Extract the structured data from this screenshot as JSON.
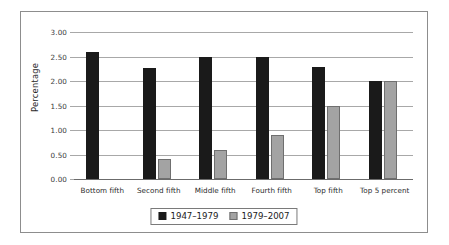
{
  "chart_data": {
    "type": "bar",
    "title": "",
    "xlabel": "",
    "ylabel": "Percentage",
    "ylim": [
      0,
      3.0
    ],
    "ytick_labels": [
      "0.00",
      "0.50",
      "1.00",
      "1.50",
      "2.00",
      "2.50",
      "3.00"
    ],
    "ytick_values": [
      0,
      0.5,
      1.0,
      1.5,
      2.0,
      2.5,
      3.0
    ],
    "grid": true,
    "legend_position": "bottom",
    "categories": [
      "Bottom fifth",
      "Second fifth",
      "Middle fifth",
      "Fourth fifth",
      "Top fifth",
      "Top 5 percent"
    ],
    "series": [
      {
        "name": "1947–1979",
        "color": "#1a1a1a",
        "values": [
          2.59,
          2.27,
          2.5,
          2.5,
          2.29,
          2.0
        ]
      },
      {
        "name": "1979–2007",
        "color": "#a3a3a3",
        "values": [
          0,
          0.4,
          0.59,
          0.89,
          1.5,
          2.0
        ]
      }
    ]
  }
}
